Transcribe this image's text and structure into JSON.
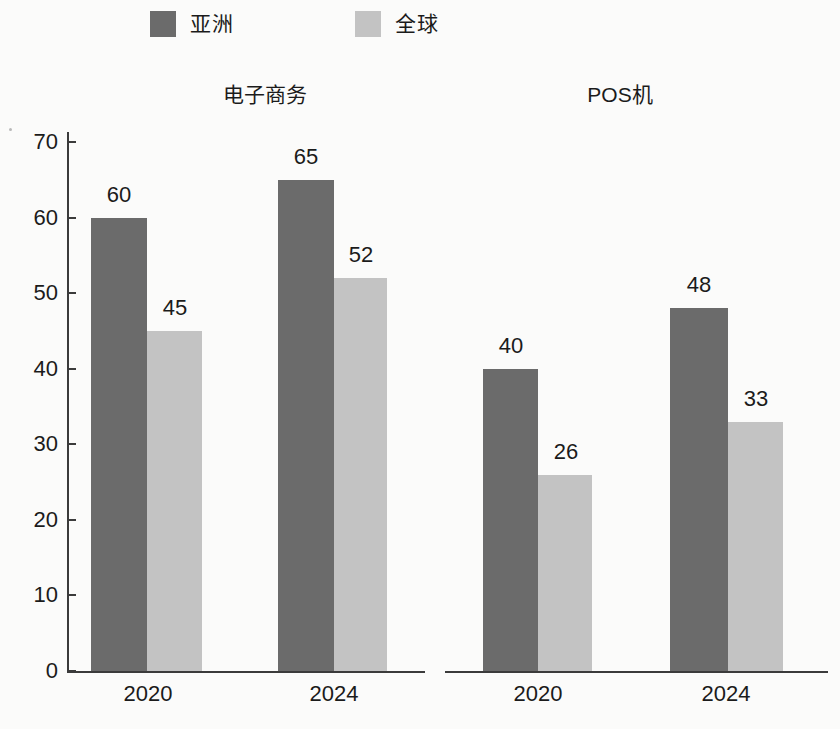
{
  "legend": {
    "entries": [
      {
        "label": "亚洲",
        "color": "#6b6b6b",
        "key": "asia"
      },
      {
        "label": "全球",
        "color": "#c3c3c3",
        "key": "global"
      }
    ]
  },
  "panels": [
    {
      "title": "电子商务"
    },
    {
      "title": "POS机"
    }
  ],
  "chart_data": {
    "type": "bar",
    "title": "",
    "subtitle": "",
    "xlabel": "",
    "ylabel": "",
    "ylim": [
      0,
      70
    ],
    "yticks": [
      0,
      10,
      20,
      30,
      40,
      50,
      60,
      70
    ],
    "ytick_labels": [
      "0",
      "10",
      "20",
      "30",
      "40",
      "50",
      "60",
      "70"
    ],
    "grid": false,
    "legend_position": "top-left",
    "legend_entries": [
      "亚洲",
      "全球"
    ],
    "categories": [
      "2020",
      "2024"
    ],
    "panels": [
      {
        "name": "电子商务",
        "categories": [
          "2020",
          "2024"
        ],
        "series": [
          {
            "name": "亚洲",
            "values": [
              60,
              65
            ]
          },
          {
            "name": "全球",
            "values": [
              45,
              52
            ]
          }
        ]
      },
      {
        "name": "POS机",
        "categories": [
          "2020",
          "2024"
        ],
        "series": [
          {
            "name": "亚洲",
            "values": [
              40,
              48
            ]
          },
          {
            "name": "全球",
            "values": [
              26,
              33
            ]
          }
        ]
      }
    ],
    "data_labels": [
      60,
      45,
      65,
      52,
      40,
      26,
      48,
      33
    ],
    "colors": {
      "亚洲": "#6b6b6b",
      "全球": "#c3c3c3"
    }
  },
  "bars": [
    {
      "panel": 0,
      "category": "2020",
      "series": "亚洲",
      "value": 60,
      "label": "60",
      "x": 91,
      "w": 56,
      "label_x": 89,
      "label_w": 60
    },
    {
      "panel": 0,
      "category": "2020",
      "series": "全球",
      "value": 45,
      "label": "45",
      "x": 147,
      "w": 55,
      "label_x": 145,
      "label_w": 60
    },
    {
      "panel": 0,
      "category": "2024",
      "series": "亚洲",
      "value": 65,
      "label": "65",
      "x": 278,
      "w": 56,
      "label_x": 276,
      "label_w": 60
    },
    {
      "panel": 0,
      "category": "2024",
      "series": "全球",
      "value": 52,
      "label": "52",
      "x": 334,
      "w": 53,
      "label_x": 331,
      "label_w": 60
    },
    {
      "panel": 1,
      "category": "2020",
      "series": "亚洲",
      "value": 40,
      "label": "40",
      "x": 483,
      "w": 55,
      "label_x": 481,
      "label_w": 60
    },
    {
      "panel": 1,
      "category": "2020",
      "series": "全球",
      "value": 26,
      "label": "26",
      "x": 538,
      "w": 54,
      "label_x": 536,
      "label_w": 60
    },
    {
      "panel": 1,
      "category": "2024",
      "series": "亚洲",
      "value": 48,
      "label": "48",
      "x": 670,
      "w": 58,
      "label_x": 669,
      "label_w": 60
    },
    {
      "panel": 1,
      "category": "2024",
      "series": "全球",
      "value": 33,
      "label": "33",
      "x": 728,
      "w": 55,
      "label_x": 726,
      "label_w": 60
    }
  ],
  "x_tick_labels": [
    {
      "text": "2020",
      "x": 90,
      "w": 116
    },
    {
      "text": "2024",
      "x": 276,
      "w": 116
    },
    {
      "text": "2020",
      "x": 480,
      "w": 116
    },
    {
      "text": "2024",
      "x": 668,
      "w": 116
    }
  ]
}
